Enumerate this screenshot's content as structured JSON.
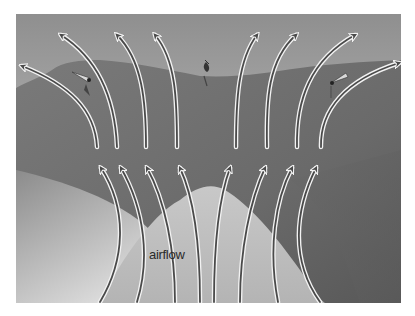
{
  "diagram": {
    "type": "airflow-illustration",
    "frame": {
      "x": 16,
      "y": 14,
      "width": 385,
      "height": 289
    },
    "labels": {
      "airflow": "airflow"
    },
    "colors": {
      "sky_top": "#9a9a9a",
      "sky_bottom": "#cfcfcf",
      "mountain": "#6e6e6e",
      "mountain_dark": "#555555",
      "valley_light": "#d6d6d6",
      "valley_mid": "#a8a8a8",
      "arrow_stroke": "#4a4a4a",
      "arrow_halo": "#f2f2f2"
    },
    "upper_arrows": [
      {
        "from": [
          97,
          147
        ],
        "to": [
          22,
          66
        ]
      },
      {
        "from": [
          117,
          147
        ],
        "to": [
          61,
          35
        ]
      },
      {
        "from": [
          146,
          147
        ],
        "to": [
          117,
          35
        ]
      },
      {
        "from": [
          177,
          147
        ],
        "to": [
          155,
          35
        ]
      },
      {
        "from": [
          236,
          147
        ],
        "to": [
          257,
          35
        ]
      },
      {
        "from": [
          267,
          147
        ],
        "to": [
          296,
          35
        ]
      },
      {
        "from": [
          297,
          147
        ],
        "to": [
          355,
          35
        ]
      },
      {
        "from": [
          321,
          147
        ],
        "to": [
          399,
          63
        ]
      }
    ],
    "lower_arrows": [
      {
        "from": [
          100,
          302
        ],
        "to": [
          101,
          168
        ]
      },
      {
        "from": [
          137,
          302
        ],
        "to": [
          121,
          168
        ]
      },
      {
        "from": [
          175,
          302
        ],
        "to": [
          147,
          168
        ]
      },
      {
        "from": [
          200,
          302
        ],
        "to": [
          180,
          168
        ]
      },
      {
        "from": [
          214,
          302
        ],
        "to": [
          230,
          168
        ]
      },
      {
        "from": [
          240,
          302
        ],
        "to": [
          265,
          168
        ]
      },
      {
        "from": [
          278,
          302
        ],
        "to": [
          292,
          168
        ]
      },
      {
        "from": [
          320,
          302
        ],
        "to": [
          316,
          168
        ]
      }
    ],
    "objects": [
      {
        "name": "plane-left",
        "x": 85,
        "y": 78
      },
      {
        "name": "bird-center",
        "x": 207,
        "y": 68
      },
      {
        "name": "plane-right",
        "x": 337,
        "y": 81
      }
    ]
  }
}
